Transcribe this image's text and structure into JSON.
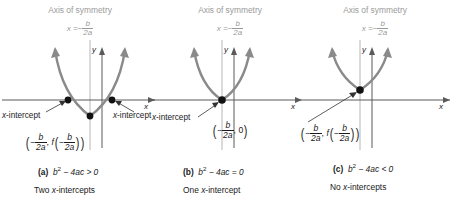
{
  "figure": {
    "colors": {
      "curve": "#7a7a7a",
      "axis": "#4d4d4d",
      "symmetry_line": "#b0b0b0",
      "heading_text": "#9a9a9a",
      "body_text": "#1a1a1a",
      "point": "#111111",
      "background": "#ffffff"
    }
  },
  "panels": [
    {
      "id": "a",
      "axis_heading": "Axis of symmetry",
      "axis_equation": {
        "lhs": "x =",
        "sign": "−",
        "num": "b",
        "den": "2a"
      },
      "y_axis_label": "y",
      "x_axis_label": "x",
      "intercept_label_left": "-intercept",
      "intercept_label_left_var": "x",
      "intercept_label_right": "-intercept",
      "intercept_label_right_var": "x",
      "vertex_label": {
        "open": "(",
        "sign1": "−",
        "num1": "b",
        "den1": "2a",
        "comma": ",",
        "f": "f",
        "open2": "(",
        "sign2": "−",
        "num2": "b",
        "den2": "2a",
        "close2": ")",
        "close": ")"
      },
      "caption_tag": "(a)",
      "caption_expr": {
        "b": "b",
        "exp": "2",
        "rest": "− 4ac > 0"
      },
      "caption_sub": {
        "count": "Two ",
        "var": "x",
        "rest": "-intercepts"
      }
    },
    {
      "id": "b",
      "axis_heading": "Axis of symmetry",
      "axis_equation": {
        "lhs": "x =",
        "sign": "−",
        "num": "b",
        "den": "2a"
      },
      "y_axis_label": "y",
      "x_axis_label": "x",
      "intercept_label_left": "-intercept",
      "intercept_label_left_var": "x",
      "vertex_label": {
        "open": "(",
        "sign1": "−",
        "num1": "b",
        "den1": "2a",
        "comma": ",",
        "zero": "0",
        "close": ")"
      },
      "caption_tag": "(b)",
      "caption_expr": {
        "b": "b",
        "exp": "2",
        "rest": "− 4ac = 0"
      },
      "caption_sub": {
        "count": "One ",
        "var": "x",
        "rest": "-intercept"
      }
    },
    {
      "id": "c",
      "axis_heading": "Axis of symmetry",
      "axis_equation": {
        "lhs": "x =",
        "sign": "−",
        "num": "b",
        "den": "2a"
      },
      "y_axis_label": "y",
      "x_axis_label": "x",
      "vertex_label": {
        "open": "(",
        "sign1": "−",
        "num1": "b",
        "den1": "2a",
        "comma": ",",
        "f": "f",
        "open2": "(",
        "sign2": "−",
        "num2": "b",
        "den2": "2a",
        "close2": ")",
        "close": ")"
      },
      "caption_tag": "(c)",
      "caption_expr": {
        "b": "b",
        "exp": "2",
        "rest": "− 4ac < 0"
      },
      "caption_sub": {
        "count": "No ",
        "var": "x",
        "rest": "-intercepts"
      }
    }
  ]
}
